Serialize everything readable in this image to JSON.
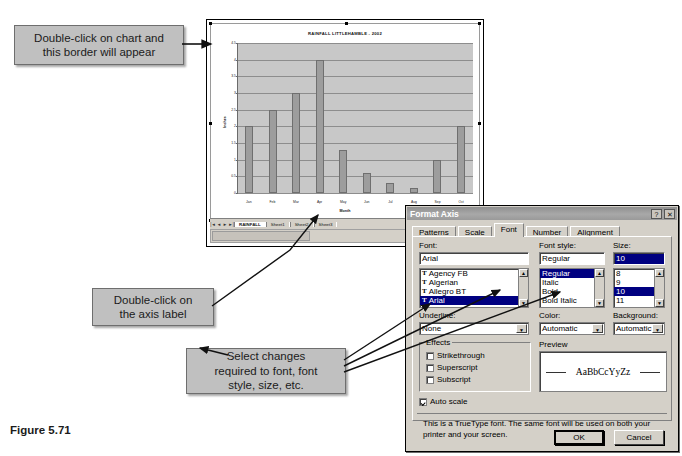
{
  "figure": {
    "caption": "Figure 5.71"
  },
  "callouts": [
    {
      "id": "chart-border",
      "line1": "Double-click on chart and",
      "line2": "this border will appear"
    },
    {
      "id": "axis-label",
      "line1": "Double-click on",
      "line2": "the axis label"
    },
    {
      "id": "font-changes",
      "line1": "Select changes",
      "line2": "required to font, font",
      "line3": "style, size, etc."
    }
  ],
  "chart_data": {
    "type": "bar",
    "title": "RAINFALL LITTLEHAMBLE - 2002",
    "xlabel": "Month",
    "ylabel": "Inches",
    "categories": [
      "Jan",
      "Feb",
      "Mar",
      "Apr",
      "May",
      "Jun",
      "Jul",
      "Aug",
      "Sep",
      "Oct"
    ],
    "values": [
      2,
      2.5,
      3,
      4,
      1.3,
      0.6,
      0.3,
      0.15,
      1.0,
      2.0
    ],
    "ylim": [
      0,
      4.5
    ],
    "yticks": [
      "0",
      "0.5",
      "1",
      "1.5",
      "2",
      "2.5",
      "3",
      "3.5",
      "4",
      "4.5"
    ],
    "grid": true,
    "legend": "none"
  },
  "workbook": {
    "nav_first": "|◄",
    "nav_prev": "◄",
    "nav_next": "►",
    "nav_last": "►|",
    "sheets": [
      "RAINFALL",
      "Sheet1",
      "Sheet2",
      "Sheet3"
    ]
  },
  "dialog": {
    "title": "Format Axis",
    "help_button": "?",
    "close_button": "✕",
    "tabs": [
      "Patterns",
      "Scale",
      "Font",
      "Number",
      "Alignment"
    ],
    "active_tab": "Font",
    "font": {
      "label": "Font:",
      "value": "Arial",
      "options": [
        "Agency FB",
        "Algerian",
        "Allegro BT",
        "Arial"
      ],
      "selected": "Arial"
    },
    "font_style": {
      "label": "Font style:",
      "value": "Regular",
      "options": [
        "Regular",
        "Italic",
        "Bold",
        "Bold Italic"
      ],
      "selected": "Regular"
    },
    "size": {
      "label": "Size:",
      "value": "10",
      "options": [
        "8",
        "9",
        "10",
        "11"
      ],
      "selected": "10"
    },
    "underline": {
      "label": "Underline:",
      "value": "None"
    },
    "color": {
      "label": "Color:",
      "value": "Automatic"
    },
    "background": {
      "label": "Background:",
      "value": "Automatic"
    },
    "effects": {
      "label": "Effects",
      "items": [
        {
          "label": "Strikethrough",
          "checked": false
        },
        {
          "label": "Superscript",
          "checked": false
        },
        {
          "label": "Subscript",
          "checked": false
        }
      ]
    },
    "preview": {
      "label": "Preview",
      "sample": "AaBbCcYyZz"
    },
    "auto_scale": {
      "label": "Auto scale",
      "checked": true
    },
    "note": "This is a TrueType font.  The same font will be used on both your printer and your screen.",
    "ok_button": "OK",
    "cancel_button": "Cancel"
  }
}
